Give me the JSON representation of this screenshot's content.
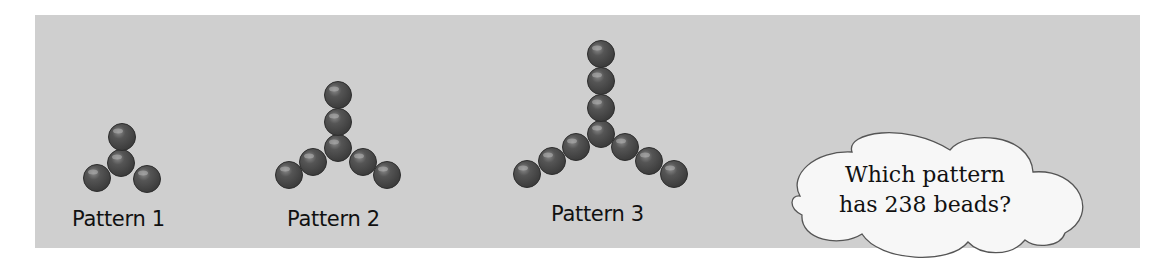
{
  "figure": {
    "background_color": "#cfcfcf",
    "bead_color": "#4a4a4a",
    "patterns": [
      {
        "label": "Pattern 1",
        "bead_count": 4,
        "beads": [
          [
            122,
            137
          ],
          [
            121,
            163
          ],
          [
            97,
            178
          ],
          [
            147,
            179
          ]
        ]
      },
      {
        "label": "Pattern 2",
        "bead_count": 7,
        "beads": [
          [
            338,
            95
          ],
          [
            338,
            122
          ],
          [
            338,
            148
          ],
          [
            313,
            162
          ],
          [
            289,
            175
          ],
          [
            363,
            162
          ],
          [
            387,
            175
          ]
        ]
      },
      {
        "label": "Pattern 3",
        "bead_count": 10,
        "beads": [
          [
            601,
            54
          ],
          [
            601,
            81
          ],
          [
            601,
            108
          ],
          [
            601,
            134
          ],
          [
            576,
            147
          ],
          [
            552,
            161
          ],
          [
            527,
            174
          ],
          [
            625,
            147
          ],
          [
            649,
            161
          ],
          [
            674,
            174
          ]
        ]
      }
    ],
    "thought_bubble": {
      "line1": "Which pattern",
      "line2": "has 238 beads?"
    }
  }
}
